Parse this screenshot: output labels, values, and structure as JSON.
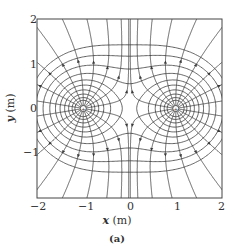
{
  "figure": {
    "caption": "(a)",
    "xlabel_var": "x",
    "xlabel_unit": " (m)",
    "ylabel_var": "y",
    "ylabel_unit": " (m)",
    "xlim": [
      -2,
      2
    ],
    "ylim": [
      -2,
      2
    ],
    "x_ticks": [
      "-2",
      "-1",
      "0",
      "1",
      "2"
    ],
    "y_ticks": [
      "2",
      "1",
      "0",
      "-1"
    ],
    "charges": [
      {
        "x": -1,
        "y": 0,
        "sign": "+"
      },
      {
        "x": 1,
        "y": 0,
        "sign": "+"
      }
    ],
    "field_lines_per_charge": 18,
    "equipotential_levels": [
      1.15,
      1.3,
      1.5,
      1.75,
      2.05,
      2.4,
      2.9,
      3.6,
      4.6,
      6.0
    ],
    "colors": {
      "line": "#3a3a3a",
      "frame": "#444444",
      "text": "#333333"
    }
  }
}
